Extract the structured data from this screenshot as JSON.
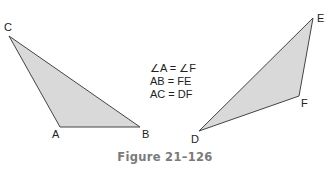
{
  "triangles": [
    {
      "name": "ABC",
      "vertices": [
        {
          "label": "C",
          "x": 9,
          "y": 36
        },
        {
          "label": "A",
          "x": 60,
          "y": 127
        },
        {
          "label": "B",
          "x": 140,
          "y": 127
        }
      ]
    },
    {
      "name": "DEF",
      "vertices": [
        {
          "label": "E",
          "x": 313,
          "y": 18
        },
        {
          "label": "F",
          "x": 299,
          "y": 96
        },
        {
          "label": "D",
          "x": 199,
          "y": 131
        }
      ]
    }
  ],
  "labels": {
    "C": "C",
    "A": "A",
    "B": "B",
    "E": "E",
    "F": "F",
    "D": "D"
  },
  "equations": [
    "∠A = ∠F",
    "AB = FE",
    "AC = DF"
  ],
  "caption": "Figure 21–126",
  "colors": {
    "fill": "#d9d9d9",
    "stroke": "#444444",
    "caption": "#7a7a7a"
  }
}
